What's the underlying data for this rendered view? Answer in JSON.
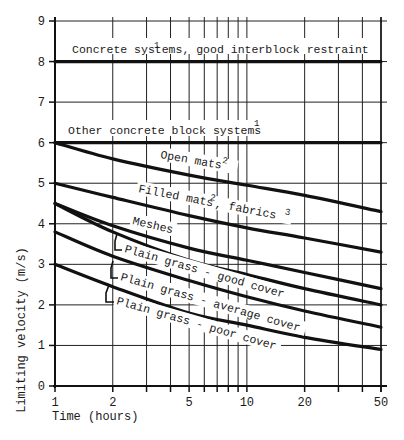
{
  "chart_data": {
    "type": "line",
    "title": "",
    "xlabel": "Time (hours)",
    "ylabel": "Limiting velocity (m/s)",
    "xscale": "log",
    "xlim": [
      1,
      50
    ],
    "ylim": [
      0,
      9
    ],
    "x_ticks": [
      1,
      2,
      5,
      10,
      20,
      50
    ],
    "x_tick_labels": [
      "1",
      "2",
      "5",
      "10",
      "20",
      "50"
    ],
    "x_minor_ticks": [
      3,
      4,
      6,
      7,
      8,
      9,
      30,
      40
    ],
    "y_ticks": [
      0,
      1,
      2,
      3,
      4,
      5,
      6,
      7,
      8,
      9
    ],
    "y_tick_labels": [
      "0",
      "1",
      "2",
      "3",
      "4",
      "5",
      "6",
      "7",
      "8",
      "9"
    ],
    "grid": true,
    "legend": "inline labels",
    "series": [
      {
        "name": "Concrete systems, good interblock restraint",
        "superscript": "1",
        "x": [
          1,
          50
        ],
        "values": [
          8.0,
          8.0
        ]
      },
      {
        "name": "Other concrete block systems",
        "superscript": "1",
        "x": [
          1,
          50
        ],
        "values": [
          6.0,
          6.0
        ]
      },
      {
        "name": "Open mats",
        "superscript": "2",
        "x": [
          1,
          2,
          5,
          10,
          20,
          50
        ],
        "values": [
          6.0,
          5.6,
          5.2,
          4.95,
          4.7,
          4.3
        ]
      },
      {
        "name": "Filled mats, fabrics",
        "superscript": "2, 3",
        "x": [
          1,
          2,
          5,
          10,
          20,
          50
        ],
        "values": [
          5.0,
          4.65,
          4.2,
          3.9,
          3.65,
          3.3
        ]
      },
      {
        "name": "Meshes",
        "superscript": "",
        "x": [
          1,
          2,
          5,
          10,
          20,
          50
        ],
        "values": [
          4.5,
          3.95,
          3.4,
          3.1,
          2.8,
          2.4
        ]
      },
      {
        "name": "Plain grass - good cover",
        "superscript": "",
        "x": [
          1,
          2,
          5,
          10,
          20,
          50
        ],
        "values": [
          4.5,
          3.8,
          3.1,
          2.75,
          2.4,
          2.0
        ]
      },
      {
        "name": "Plain grass - average cover",
        "superscript": "",
        "x": [
          1,
          2,
          5,
          10,
          20,
          50
        ],
        "values": [
          3.8,
          3.2,
          2.6,
          2.2,
          1.85,
          1.45
        ]
      },
      {
        "name": "Plain grass - poor cover",
        "superscript": "",
        "x": [
          1,
          2,
          5,
          10,
          20,
          50
        ],
        "values": [
          3.0,
          2.45,
          1.8,
          1.5,
          1.2,
          0.9
        ]
      }
    ]
  },
  "labels": {
    "xlabel": "Time (hours)",
    "ylabel": "Limiting velocity (m/s)",
    "concrete_good": "Concrete systems, good interblock restraint",
    "concrete_good_sup": "1",
    "other_concrete": "Other concrete block systems",
    "other_concrete_sup": "1",
    "open_mats": "Open mats",
    "open_mats_sup": "2",
    "filled_mats": "Filled mats",
    "filled_mats_sup": "2",
    "fabrics": ", fabrics",
    "fabrics_sup": "3",
    "meshes": "Meshes",
    "grass_good": "Plain grass - good cover",
    "grass_average": "Plain grass - average cover",
    "grass_poor": "Plain grass - poor cover"
  }
}
